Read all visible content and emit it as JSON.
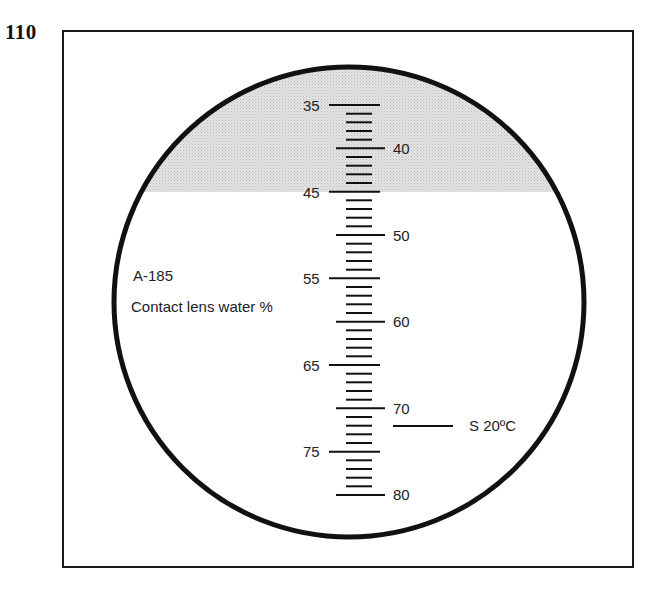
{
  "figure": {
    "number": "110",
    "model": "A-185",
    "scale_title": "Contact lens water %",
    "calibration": "S 20ºC",
    "colors": {
      "line": "#111111",
      "shade": "#d9d9d9",
      "background": "#ffffff"
    }
  },
  "scale": {
    "min": 35,
    "max": 80,
    "step_minor": 1,
    "labels_left": [
      "35",
      "45",
      "55",
      "65",
      "75"
    ],
    "labels_right": [
      "40",
      "50",
      "60",
      "70",
      "80"
    ],
    "shaded_range": [
      35,
      45
    ]
  }
}
